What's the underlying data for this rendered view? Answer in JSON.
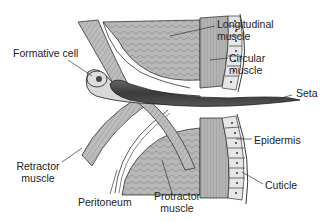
{
  "diagram": {
    "labels": {
      "formative_cell": "Formative cell",
      "longitudinal_muscle_1": "Longitudinal",
      "longitudinal_muscle_2": "muscle",
      "circular_muscle_1": "Circular",
      "circular_muscle_2": "muscle",
      "seta": "Seta",
      "epidermis": "Epidermis",
      "retractor_muscle_1": "Retractor",
      "retractor_muscle_2": "muscle",
      "cuticle": "Cuticle",
      "peritoneum": "Peritoneum",
      "protractor_muscle_1": "Protractor",
      "protractor_muscle_2": "muscle"
    },
    "colors": {
      "muscle_fill": "#b8b8b8",
      "dark_muscle_fill": "#9a9a9a",
      "seta_fill": "#4a4a4a",
      "cell_fill": "#e4e4e4",
      "outline": "#333333",
      "background": "#ffffff"
    }
  }
}
